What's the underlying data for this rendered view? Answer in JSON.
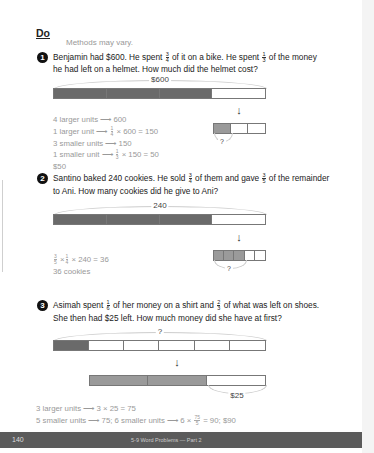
{
  "header": {
    "title": "Do",
    "note": "Methods may vary."
  },
  "problems": [
    {
      "number": "1",
      "text_line1_a": "Benjamin had $600. He spent ",
      "frac1": {
        "num": "3",
        "den": "4"
      },
      "text_line1_b": " of it on a bike. He spent ",
      "frac2": {
        "num": "1",
        "den": "3"
      },
      "text_line1_c": " of the money",
      "text_line2": "he had left on a helmet. How much did the helmet cost?",
      "bar_label": "$600",
      "bar_units": 4,
      "bar_shaded": 3,
      "sub_bar_units": 3,
      "sub_bar_shaded": 1,
      "sub_label": "?",
      "arrow": "↓",
      "solution": [
        "4 larger units ⟶ 600",
        "1 larger unit ⟶ ",
        "3 smaller units ⟶ 150",
        "1 smaller unit ⟶ ",
        "$50"
      ],
      "sol_line2_frac": {
        "num": "1",
        "den": "4"
      },
      "sol_line2_rest": " × 600 = 150",
      "sol_line4_frac": {
        "num": "1",
        "den": "3"
      },
      "sol_line4_rest": " × 150 = 50"
    },
    {
      "number": "2",
      "text_line1_a": "Santino baked 240 cookies. He sold ",
      "frac1": {
        "num": "3",
        "den": "4"
      },
      "text_line1_b": " of them and gave ",
      "frac2": {
        "num": "3",
        "den": "5"
      },
      "text_line1_c": " of the remainder",
      "text_line2": "to Ani. How many cookies did he give to Ani?",
      "bar_label": "240",
      "bar_units": 4,
      "bar_shaded": 3,
      "sub_bar_units": 5,
      "sub_bar_shaded": 3,
      "sub_label": "?",
      "arrow": "↓",
      "sol_frac_a": {
        "num": "3",
        "den": "5"
      },
      "sol_times": " ×",
      "sol_frac_b": {
        "num": "1",
        "den": "4"
      },
      "sol_rest": " × 240 = 36",
      "sol_answer": "36 cookies"
    },
    {
      "number": "3",
      "text_line1_a": "Asimah spent ",
      "frac1": {
        "num": "1",
        "den": "6"
      },
      "text_line1_b": " of her money on a shirt and ",
      "frac2": {
        "num": "2",
        "den": "3"
      },
      "text_line1_c": " of what was left on shoes.",
      "text_line2": "She then had $25 left. How much money did she have at first?",
      "bar_label": "?",
      "bar_units": 6,
      "bar_shaded": 1,
      "sub_bar_units": 3,
      "sub_bar_shaded": 2,
      "sub_label": "$25",
      "arrow": "↓",
      "sol_line1": "3 larger units ⟶ 3 × 25 = 75",
      "sol_line2_a": "5 smaller units ⟶ 75;  6 smaller units ⟶ 6 × ",
      "sol_line2_frac": {
        "num": "75",
        "den": "5"
      },
      "sol_line2_b": " = 90;  $90"
    }
  ],
  "footer": {
    "page_number": "140",
    "title": "5-9  Word Problems — Part 2"
  }
}
